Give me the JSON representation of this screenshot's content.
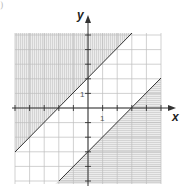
{
  "corner_label": ")",
  "chart_data": {
    "type": "line",
    "title": "",
    "xlabel": "x",
    "ylabel": "y",
    "xlim": [
      -5,
      5
    ],
    "ylim": [
      -5,
      5
    ],
    "grid": true,
    "tick_labels": {
      "x": "1",
      "y": "1"
    },
    "series": [
      {
        "name": "boundary-upper",
        "equation": "y = x + 2",
        "points": [
          [
            -5,
            -3
          ],
          [
            3,
            5
          ]
        ],
        "shaded_side": "above",
        "hatch": "vertical"
      },
      {
        "name": "boundary-lower",
        "equation": "y = x - 3",
        "points": [
          [
            -2,
            -5
          ],
          [
            5,
            2
          ]
        ],
        "shaded_side": "below",
        "hatch": "horizontal"
      }
    ],
    "colors": {
      "line": "#333333",
      "grid": "#bdbdbd",
      "shade": "#e6e6e6",
      "hatch": "#c8c8c8"
    }
  }
}
